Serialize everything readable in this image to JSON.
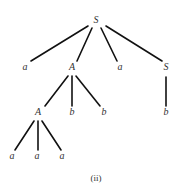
{
  "caption": "(ii)",
  "nodes": [
    {
      "id": "n0",
      "label": "S",
      "x": 96,
      "y": 23
    },
    {
      "id": "n1",
      "label": "a",
      "x": 25,
      "y": 70
    },
    {
      "id": "n2",
      "label": "A",
      "x": 72,
      "y": 70
    },
    {
      "id": "n3",
      "label": "a",
      "x": 120,
      "y": 70
    },
    {
      "id": "n4",
      "label": "S",
      "x": 166,
      "y": 70
    },
    {
      "id": "n5",
      "label": "A",
      "x": 38,
      "y": 115
    },
    {
      "id": "n6",
      "label": "b",
      "x": 72,
      "y": 115
    },
    {
      "id": "n7",
      "label": "b",
      "x": 104,
      "y": 115
    },
    {
      "id": "n8",
      "label": "b",
      "x": 166,
      "y": 115
    },
    {
      "id": "n9",
      "label": "a",
      "x": 12,
      "y": 159
    },
    {
      "id": "n10",
      "label": "a",
      "x": 37,
      "y": 159
    },
    {
      "id": "n11",
      "label": "a",
      "x": 62,
      "y": 159
    }
  ],
  "edges": [
    {
      "x1": 88,
      "y1": 26,
      "x2": 31,
      "y2": 61
    },
    {
      "x1": 92,
      "y1": 28,
      "x2": 77,
      "y2": 61
    },
    {
      "x1": 101,
      "y1": 28,
      "x2": 117,
      "y2": 61
    },
    {
      "x1": 106,
      "y1": 26,
      "x2": 162,
      "y2": 61
    },
    {
      "x1": 68,
      "y1": 76,
      "x2": 45,
      "y2": 106
    },
    {
      "x1": 72,
      "y1": 76,
      "x2": 72,
      "y2": 106
    },
    {
      "x1": 76,
      "y1": 76,
      "x2": 100,
      "y2": 106
    },
    {
      "x1": 166,
      "y1": 77,
      "x2": 166,
      "y2": 106
    },
    {
      "x1": 34,
      "y1": 121,
      "x2": 15,
      "y2": 150
    },
    {
      "x1": 38,
      "y1": 121,
      "x2": 38,
      "y2": 150
    },
    {
      "x1": 42,
      "y1": 121,
      "x2": 61,
      "y2": 150
    }
  ]
}
